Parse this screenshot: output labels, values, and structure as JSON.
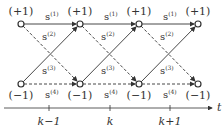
{
  "diagram": {
    "type": "trellis",
    "states": {
      "top": "(+1)",
      "bottom": "(−1)"
    },
    "branch_symbol": "s",
    "branches": {
      "top_to_top": "(1)",
      "top_to_bottom": "(2)",
      "bottom_to_top": "(3)",
      "bottom_to_bottom": "(4)"
    },
    "axis": {
      "label": "t",
      "ticks": [
        "k−1",
        "k",
        "k+1"
      ]
    },
    "colors": {
      "line": "#333333",
      "node_fill": "#ffffff"
    }
  }
}
